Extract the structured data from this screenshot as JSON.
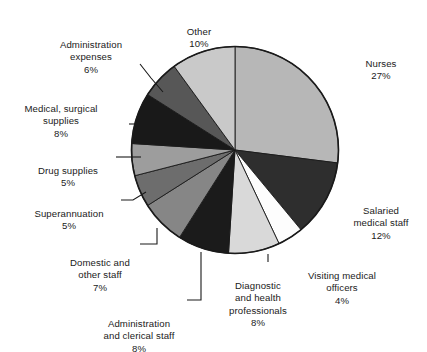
{
  "chart_data": {
    "type": "pie",
    "title": "",
    "subtitle": "",
    "xlabel": "",
    "ylabel": "",
    "legend_position": "callout-labels",
    "grid": false,
    "units": "percent",
    "start_angle_deg": 0,
    "direction": "clockwise",
    "categories": [
      "Nurses",
      "Salaried medical staff",
      "Visiting medical officers",
      "Diagnostic and health professionals",
      "Administration and clerical staff",
      "Domestic and other staff",
      "Superannuation",
      "Drug supplies",
      "Medical, surgical supplies",
      "Administration expenses",
      "Other"
    ],
    "values": [
      27,
      12,
      4,
      8,
      8,
      7,
      5,
      5,
      8,
      6,
      10
    ],
    "colors": [
      "#b7b7b7",
      "#2e2e2e",
      "#fdfdfd",
      "#d9d9d9",
      "#1b1b1b",
      "#868686",
      "#6d6d6d",
      "#9d9d9d",
      "#191919",
      "#575757",
      "#c9c9c9"
    ],
    "slice_outline_color": "#1a1a1a",
    "background_color": "#ffffff"
  },
  "labels": [
    {
      "id": "nurses",
      "name": "Nurses",
      "percent": "27%",
      "lines": "Nurses"
    },
    {
      "id": "salaried-medical-staff",
      "name": "Salaried medical staff",
      "percent": "12%",
      "lines": "Salaried\nmedical staff"
    },
    {
      "id": "visiting-medical-officers",
      "name": "Visiting medical officers",
      "percent": "4%",
      "lines": "Visiting medical\nofficers"
    },
    {
      "id": "diagnostic-health-professionals",
      "name": "Diagnostic and health professionals",
      "percent": "8%",
      "lines": "Diagnostic\nand health\nprofessionals"
    },
    {
      "id": "administration-clerical-staff",
      "name": "Administration and clerical staff",
      "percent": "8%",
      "lines": "Administration\nand clerical staff"
    },
    {
      "id": "domestic-other-staff",
      "name": "Domestic and other staff",
      "percent": "7%",
      "lines": "Domestic and\nother staff"
    },
    {
      "id": "superannuation",
      "name": "Superannuation",
      "percent": "5%",
      "lines": "Superannuation"
    },
    {
      "id": "drug-supplies",
      "name": "Drug supplies",
      "percent": "5%",
      "lines": "Drug supplies"
    },
    {
      "id": "medical-surgical-supplies",
      "name": "Medical, surgical supplies",
      "percent": "8%",
      "lines": "Medical, surgical\nsupplies"
    },
    {
      "id": "administration-expenses",
      "name": "Administration expenses",
      "percent": "6%",
      "lines": "Administration\nexpenses"
    },
    {
      "id": "other",
      "name": "Other",
      "percent": "10%",
      "lines": "Other"
    }
  ]
}
